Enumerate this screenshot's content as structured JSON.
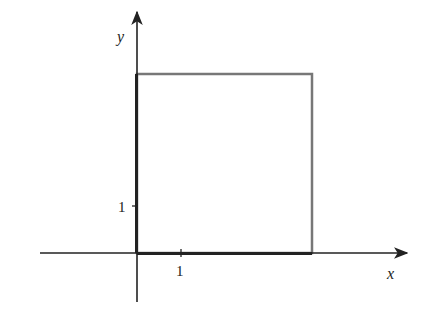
{
  "diagram": {
    "axes": {
      "x_label": "x",
      "y_label": "y",
      "x_tick_label": "1",
      "y_tick_label": "1"
    },
    "shape": {
      "type": "square",
      "corner_origin": [
        0,
        0
      ],
      "width_units": 3.8,
      "height_units": 3.8,
      "edge_color": "#777777",
      "axis_color": "#222222"
    }
  }
}
